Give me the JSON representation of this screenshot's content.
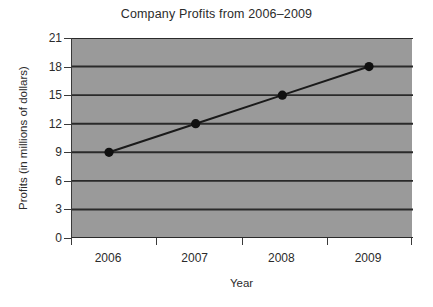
{
  "chart_data": {
    "type": "line",
    "title": "Company Profits from 2006–2009",
    "xlabel": "Year",
    "ylabel": "Profits (in millions of dollars)",
    "categories": [
      "2006",
      "2007",
      "2008",
      "2009"
    ],
    "x": [
      2006,
      2007,
      2008,
      2009
    ],
    "values": [
      9,
      12,
      15,
      18
    ],
    "series": [
      {
        "name": "Profits",
        "values": [
          9,
          12,
          15,
          18
        ]
      }
    ],
    "ylim": [
      0,
      21
    ],
    "yticks": [
      0,
      3,
      6,
      9,
      12,
      15,
      18,
      21
    ],
    "ytick_labels": [
      "0",
      "3",
      "6",
      "9",
      "12",
      "15",
      "18",
      "21"
    ],
    "xtick_labels": [
      "2006",
      "2007",
      "2008",
      "2009"
    ],
    "grid": "horizontal",
    "legend": "none",
    "colors": {
      "plot_background": "#9a9a9a",
      "figure_background": "#ffffff",
      "line": "#1a1a1a",
      "marker": "#101010",
      "gridline": "#2a2a2a",
      "axis": "#3a3a3a",
      "text": "#2b2b2b"
    }
  }
}
